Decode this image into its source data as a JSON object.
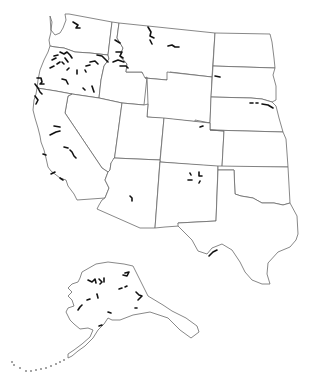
{
  "map": {
    "title": "",
    "colors": {
      "background": "#ffffff",
      "border": "#6a6a6a",
      "feature": "#111111"
    },
    "states": [
      {
        "name": "washington",
        "d": "M50,16 L52,22 L51,30 L55,35 L60,33 L63,28 L66,20 L65,14 L69,14 L112,22 L108,55 L90,53 L75,52 L64,48 L55,47 L50,46 L49,40 L51,32 Z"
      },
      {
        "name": "oregon",
        "d": "M50,46 L55,47 L64,48 L75,52 L90,53 L108,55 L109,59 L104,66 L101,80 L99,98 L72,94 L56,91 L37,88 L38,80 L40,70 L44,60 L48,52 Z"
      },
      {
        "name": "idaho",
        "d": "M112,22 L119,23 L117,38 L123,48 L120,56 L127,64 L126,72 L138,72 L142,72 L143,74 L147,77 L144,105 L122,103 L99,98 L101,80 L104,66 L109,59 L108,55 Z"
      },
      {
        "name": "montana",
        "d": "M119,23 L215,33 L212,77 L170,72 L167,80 L145,78 L142,72 L138,72 L126,72 L127,64 L120,56 L123,48 L117,38 Z"
      },
      {
        "name": "wyoming",
        "d": "M167,72 L212,77 L210,123 L147,117 L148,104 L147,77 L145,78 L167,80 Z"
      },
      {
        "name": "north-dakota",
        "d": "M215,33 L270,34 L272,42 L274,58 L275,68 L213,66 Z"
      },
      {
        "name": "south-dakota",
        "d": "M213,66 L275,68 L273,75 L276,86 L276,100 L272,102 L262,99 L251,98 L211,97 Z"
      },
      {
        "name": "nebraska",
        "d": "M211,97 L251,98 L262,99 L272,102 L276,106 L279,118 L283,132 L210,130 L210,123 L195,122 L195,120 L210,123 Z"
      },
      {
        "name": "nevada",
        "d": "M72,94 L99,98 L122,103 L114,162 L111,163 L110,170 L108,172 L102,168 L65,113 L68,96 Z"
      },
      {
        "name": "california",
        "d": "M37,88 L56,91 L72,94 L68,96 L65,113 L102,168 L108,172 L105,180 L109,188 L105,198 L77,200 L74,194 L68,186 L66,180 L60,178 L51,171 L48,167 L46,158 L44,150 L41,142 L40,136 L38,128 L35,118 L33,110 L34,100 L36,94 Z"
      },
      {
        "name": "utah",
        "d": "M122,103 L144,105 L148,104 L147,117 L164,118 L160,160 L114,158 L114,162 Z"
      },
      {
        "name": "colorado",
        "d": "M164,118 L210,123 L210,130 L224,131 L222,167 L160,162 Z"
      },
      {
        "name": "kansas",
        "d": "M210,130 L283,132 L286,139 L288,167 L222,167 L224,131 Z"
      },
      {
        "name": "arizona",
        "d": "M114,158 L160,160 L155,228 L140,228 L97,209 L99,205 L102,200 L105,198 L109,188 L105,180 L108,172 L110,170 L111,163 Z"
      },
      {
        "name": "new-mexico",
        "d": "M160,162 L218,166 L216,221 L178,223 L179,226 L165,227 L155,228 Z"
      },
      {
        "name": "oklahoma",
        "d": "M218,166 L288,167 L290,203 L283,205 L274,203 L262,203 L253,198 L241,196 L235,194 L234,170 L218,170 Z"
      },
      {
        "name": "texas",
        "d": "M218,170 L234,170 L235,194 L241,196 L253,198 L262,203 L274,203 L283,205 L290,203 L297,216 L298,234 L296,240 L290,247 L278,252 L268,263 L267,274 L270,284 L262,284 L252,280 L245,272 L240,262 L232,250 L222,244 L212,248 L207,254 L198,251 L192,240 L184,232 L178,226 L178,223 L216,221 Z"
      },
      {
        "name": "alaska",
        "d": "M82,272 L96,264 L108,262 L124,264 L133,266 L148,296 L163,305 L172,311 L186,318 L197,326 L199,332 L191,338 L180,330 L168,318 L150,312 L133,315 L120,320 L112,320 L108,318 L104,324 L98,330 L93,338 L85,346 L78,351 L72,356 L68,358 L68,354 L74,350 L82,344 L90,337 L93,330 L88,328 L80,329 L74,324 L70,320 L66,312 L68,308 L74,306 L72,300 L68,296 L72,292 L68,288 L72,284 L78,282 L80,278 Z"
      }
    ],
    "features": [
      {
        "name": "washington-segment",
        "d": "M73,22 L78,25 L76,28 L80,28"
      },
      {
        "name": "montana-segment-1",
        "d": "M148,27 L151,32 L150,36 L154,38"
      },
      {
        "name": "montana-segment-2",
        "d": "M150,40 L152,44"
      },
      {
        "name": "montana-segment-3",
        "d": "M168,46 L172,45 L175,47 L179,47"
      },
      {
        "name": "montana-segment-4",
        "d": "M215,76 L220,77"
      },
      {
        "name": "idaho-segment-1",
        "d": "M115,40 L120,43"
      },
      {
        "name": "idaho-segment-2",
        "d": "M116,52 L122,52 L120,56 L123,58"
      },
      {
        "name": "idaho-segment-3",
        "d": "M113,62 L118,60 L124,62"
      },
      {
        "name": "idaho-segment-4",
        "d": "M120,66 L126,66 L128,68"
      },
      {
        "name": "oregon-segment-1",
        "d": "M60,52 L64,54 L67,52 L70,55 L72,58"
      },
      {
        "name": "oregon-segment-2",
        "d": "M65,58 L68,62"
      },
      {
        "name": "oregon-segment-3",
        "d": "M54,56 L58,55"
      },
      {
        "name": "oregon-segment-4",
        "d": "M52,60 L56,58"
      },
      {
        "name": "oregon-segment-5",
        "d": "M62,62 L64,64"
      },
      {
        "name": "oregon-segment-6",
        "d": "M97,55 L102,56 L106,60 L108,62"
      },
      {
        "name": "oregon-segment-7",
        "d": "M90,62 L95,61 L98,64"
      },
      {
        "name": "oregon-segment-8",
        "d": "M86,66 L90,65"
      },
      {
        "name": "oregon-segment-9",
        "d": "M57,64 L60,62"
      },
      {
        "name": "oregon-segment-10",
        "d": "M50,68 L54,66"
      },
      {
        "name": "oregon-segment-11",
        "d": "M67,70 L69,68"
      },
      {
        "name": "oregon-segment-12",
        "d": "M77,70 L77,74"
      },
      {
        "name": "oregon-segment-13",
        "d": "M85,70 L86,72"
      },
      {
        "name": "oregon-segment-14",
        "d": "M62,79 L66,80 L68,84"
      },
      {
        "name": "oregon-segment-15",
        "d": "M83,88 L85,90"
      },
      {
        "name": "oregon-segment-16",
        "d": "M92,86 L94,92"
      },
      {
        "name": "oregon-coast-segment-1",
        "d": "M37,78 L41,78 L42,82 L40,84 L44,84"
      },
      {
        "name": "oregon-coast-segment-2",
        "d": "M35,84 L38,88 L40,92 L42,94"
      },
      {
        "name": "california-segment-1",
        "d": "M35,96 L38,100 L36,104"
      },
      {
        "name": "california-segment-2",
        "d": "M54,126 L60,127"
      },
      {
        "name": "california-segment-3",
        "d": "M50,135 L56,132 L60,131"
      },
      {
        "name": "california-segment-4",
        "d": "M64,147 L68,148"
      },
      {
        "name": "california-segment-5",
        "d": "M70,150 L72,152 L74,156 L76,158"
      },
      {
        "name": "california-segment-6",
        "d": "M43,154 L46,155"
      },
      {
        "name": "california-segment-7",
        "d": "M51,174 L55,172"
      },
      {
        "name": "california-segment-8",
        "d": "M60,178 L63,180"
      },
      {
        "name": "arizona-segment",
        "d": "M130,196 L132,198 L132,201"
      },
      {
        "name": "colorado-segment",
        "d": "M200,127 L203,126"
      },
      {
        "name": "new-mexico-segment-1",
        "d": "M199,172 L199,176 L202,176"
      },
      {
        "name": "new-mexico-segment-2",
        "d": "M190,173 L191,175"
      },
      {
        "name": "new-mexico-segment-3",
        "d": "M188,180 L192,180"
      },
      {
        "name": "new-mexico-segment-4",
        "d": "M199,183 L200,181"
      },
      {
        "name": "nebraska-segment-1",
        "d": "M250,103 L253,103"
      },
      {
        "name": "nebraska-segment-2",
        "d": "M256,103 L258,103"
      },
      {
        "name": "nebraska-segment-3",
        "d": "M262,104 L268,105 L273,108"
      },
      {
        "name": "texas-rio-grande-segment",
        "d": "M209,256 L213,252 L217,250"
      },
      {
        "name": "alaska-segment-1",
        "d": "M88,280 L92,282 L95,279 L96,283"
      },
      {
        "name": "alaska-segment-2",
        "d": "M99,279 L102,282 L100,284"
      },
      {
        "name": "alaska-segment-3",
        "d": "M104,278 L104,282"
      },
      {
        "name": "alaska-segment-4",
        "d": "M125,273 L129,272 L127,276 L123,275"
      },
      {
        "name": "alaska-segment-5",
        "d": "M119,289 L122,288"
      },
      {
        "name": "alaska-segment-6",
        "d": "M125,287 L127,286"
      },
      {
        "name": "alaska-segment-7",
        "d": "M97,294 L98,298"
      },
      {
        "name": "alaska-segment-8",
        "d": "M87,300 L90,299"
      },
      {
        "name": "alaska-segment-9",
        "d": "M136,292 L139,295 L142,296 L138,300"
      },
      {
        "name": "alaska-segment-10",
        "d": "M78,310 L80,307 L82,305"
      },
      {
        "name": "alaska-segment-11",
        "d": "M135,308 L137,308"
      },
      {
        "name": "alaska-segment-12",
        "d": "M108,312 L111,313"
      },
      {
        "name": "alaska-segment-13",
        "d": "M99,326 L102,325"
      }
    ],
    "dots": [
      {
        "name": "aleutian-dot",
        "cx": 12,
        "cy": 362
      },
      {
        "name": "aleutian-dot",
        "cx": 14,
        "cy": 365
      },
      {
        "name": "aleutian-dot",
        "cx": 20,
        "cy": 368
      },
      {
        "name": "aleutian-dot",
        "cx": 26,
        "cy": 371
      },
      {
        "name": "aleutian-dot",
        "cx": 31,
        "cy": 371
      },
      {
        "name": "aleutian-dot",
        "cx": 36,
        "cy": 370
      },
      {
        "name": "aleutian-dot",
        "cx": 41,
        "cy": 369
      },
      {
        "name": "aleutian-dot",
        "cx": 46,
        "cy": 368
      },
      {
        "name": "aleutian-dot",
        "cx": 51,
        "cy": 366
      },
      {
        "name": "aleutian-dot",
        "cx": 56,
        "cy": 364
      },
      {
        "name": "aleutian-dot",
        "cx": 60,
        "cy": 362
      },
      {
        "name": "aleutian-dot",
        "cx": 64,
        "cy": 360
      }
    ]
  }
}
